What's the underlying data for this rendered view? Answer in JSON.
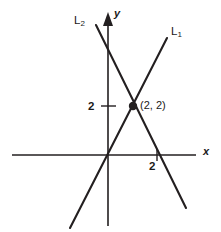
{
  "figure": {
    "background_color": "#ffffff",
    "stroke_color": "#231f20",
    "axes": {
      "x_axis_label": "x",
      "y_axis_label": "y",
      "x_axis": {
        "x1": 12,
        "y1": 155,
        "x2": 196,
        "y2": 155,
        "width": 1.4
      },
      "y_axis": {
        "x1": 108,
        "y1": 22,
        "x2": 108,
        "y2": 226,
        "width": 1.6
      },
      "y_arrow": {
        "tip_x": 108,
        "tip_y": 12,
        "half_width": 5,
        "length": 14
      }
    },
    "ticks": [
      {
        "name": "y-tick-2",
        "label": "2",
        "axis": "y",
        "value": 2,
        "mark": {
          "x1": 101,
          "y1": 106,
          "x2": 116,
          "y2": 106
        },
        "label_x": 88,
        "label_y": 101
      },
      {
        "name": "x-tick-2",
        "label": "2",
        "axis": "x",
        "value": 2,
        "mark": {
          "x1": 157,
          "y1": 149,
          "x2": 157,
          "y2": 161
        },
        "label_x": 149,
        "label_y": 161
      }
    ],
    "lines": [
      {
        "name": "L1",
        "label": "L",
        "subscript": "1",
        "slope_sign": "positive",
        "x1": 70,
        "y1": 228,
        "x2": 167,
        "y2": 38,
        "label_x": 171,
        "label_y": 26
      },
      {
        "name": "L2",
        "label": "L",
        "subscript": "2",
        "slope_sign": "negative",
        "x1": 96,
        "y1": 25,
        "x2": 186,
        "y2": 208,
        "label_x": 74,
        "label_y": 15
      }
    ],
    "points": [
      {
        "name": "intersection",
        "label": "(2, 2)",
        "cx": 133,
        "cy": 106,
        "r": 4.2,
        "label_x": 140,
        "label_y": 100
      }
    ]
  }
}
